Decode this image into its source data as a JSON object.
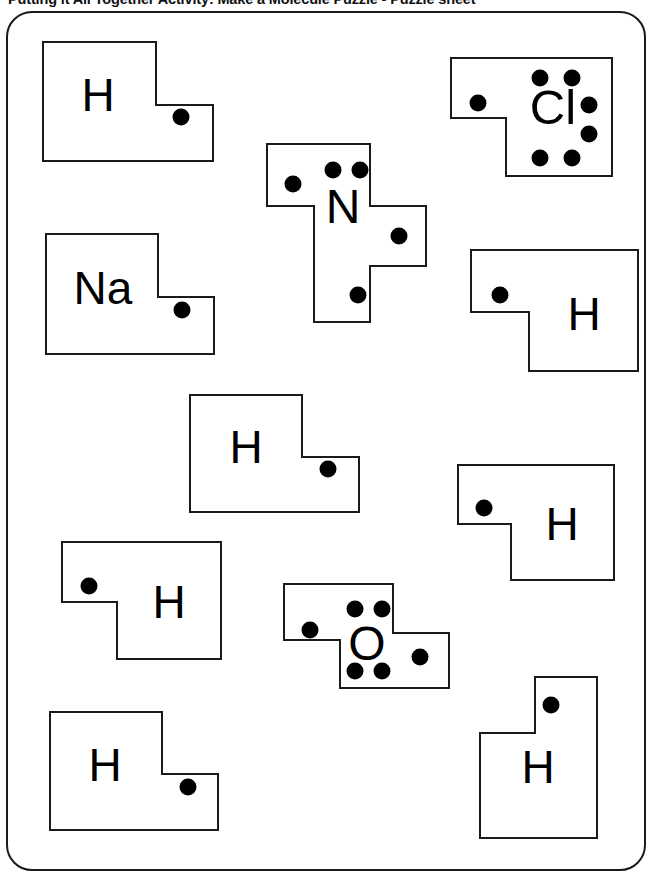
{
  "document": {
    "title": "Putting it All Together Activity: Make a Molecule Puzzle - Puzzle sheet",
    "frame_color": "#1a1a1a",
    "background_color": "#ffffff",
    "ink_color": "#000000",
    "width": 656,
    "height": 879
  },
  "sheet": {
    "kind": "lewis-dot-puzzle-pieces",
    "piece_count": 11,
    "pieces": [
      {
        "id": "piece-h-1",
        "symbol": "H",
        "element_name": "hydrogen",
        "shape": "step-right-tab",
        "dots": 1,
        "dot_positions": [
          "tab"
        ],
        "x": 42,
        "y": 41,
        "w": 172,
        "h": 119
      },
      {
        "id": "piece-cl-1",
        "symbol": "Cl",
        "element_name": "chlorine",
        "shape": "step-left-tab",
        "dots": 7,
        "dot_positions": [
          "tab",
          "top-left",
          "top-right",
          "right-upper",
          "right-lower",
          "bottom-left",
          "bottom-right"
        ],
        "x": 450,
        "y": 57,
        "w": 163,
        "h": 119
      },
      {
        "id": "piece-n-1",
        "symbol": "N",
        "element_name": "nitrogen",
        "shape": "cross-three-tabs",
        "dots": 5,
        "dot_positions": [
          "tab-left",
          "tab-right",
          "tab-bottom",
          "top-left",
          "top-right"
        ],
        "x": 266,
        "y": 143,
        "w": 175,
        "h": 178
      },
      {
        "id": "piece-na-1",
        "symbol": "Na",
        "element_name": "sodium",
        "shape": "step-right-tab",
        "dots": 1,
        "dot_positions": [
          "tab"
        ],
        "x": 45,
        "y": 233,
        "w": 170,
        "h": 120
      },
      {
        "id": "piece-h-2",
        "symbol": "H",
        "element_name": "hydrogen",
        "shape": "step-left-tab",
        "dots": 1,
        "dot_positions": [
          "tab"
        ],
        "x": 470,
        "y": 249,
        "w": 170,
        "h": 122
      },
      {
        "id": "piece-h-3",
        "symbol": "H",
        "element_name": "hydrogen",
        "shape": "step-right-tab",
        "dots": 1,
        "dot_positions": [
          "tab"
        ],
        "x": 189,
        "y": 394,
        "w": 172,
        "h": 118
      },
      {
        "id": "piece-h-4",
        "symbol": "H",
        "element_name": "hydrogen",
        "shape": "step-left-tab",
        "dots": 1,
        "dot_positions": [
          "tab"
        ],
        "x": 457,
        "y": 464,
        "w": 158,
        "h": 116
      },
      {
        "id": "piece-h-5",
        "symbol": "H",
        "element_name": "hydrogen",
        "shape": "step-left-tab",
        "dots": 1,
        "dot_positions": [
          "tab"
        ],
        "x": 61,
        "y": 541,
        "w": 161,
        "h": 118
      },
      {
        "id": "piece-o-1",
        "symbol": "O",
        "element_name": "oxygen",
        "shape": "z-two-tabs",
        "dots": 6,
        "dot_positions": [
          "tab-left",
          "tab-right",
          "top-left",
          "top-right",
          "bottom-left",
          "bottom-right"
        ],
        "x": 283,
        "y": 583,
        "w": 166,
        "h": 105
      },
      {
        "id": "piece-h-6",
        "symbol": "H",
        "element_name": "hydrogen",
        "shape": "step-right-tab",
        "dots": 1,
        "dot_positions": [
          "tab"
        ],
        "x": 49,
        "y": 711,
        "w": 171,
        "h": 119
      },
      {
        "id": "piece-h-7",
        "symbol": "H",
        "element_name": "hydrogen",
        "shape": "step-up-tab",
        "dots": 1,
        "dot_positions": [
          "tab"
        ],
        "x": 479,
        "y": 676,
        "w": 120,
        "h": 162
      }
    ]
  }
}
